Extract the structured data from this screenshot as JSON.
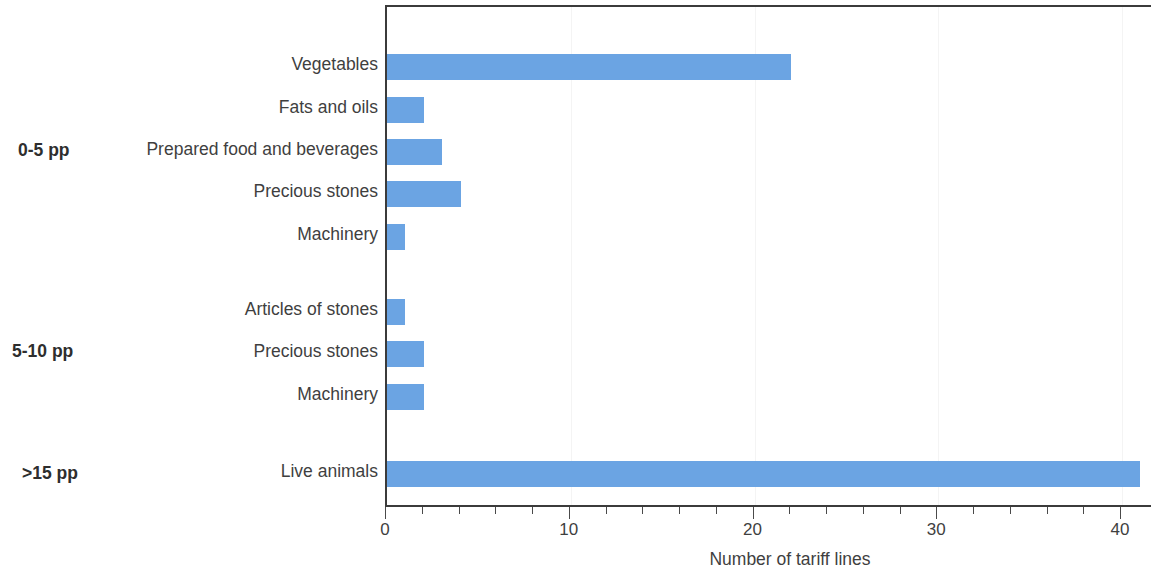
{
  "chart_data": {
    "type": "bar",
    "orientation": "horizontal",
    "title": "",
    "xlabel": "Number of tariff lines",
    "ylabel": "",
    "xlim": [
      0,
      41.7
    ],
    "xticks": [
      0,
      10,
      20,
      30,
      40
    ],
    "xtick_labels": [
      "0",
      "10",
      "20",
      "30",
      "40"
    ],
    "minor_tick_step": 2,
    "grid": "faint vertical gridlines at major ticks",
    "legend": "none",
    "bar_color": "#6ba4e3",
    "groups": [
      {
        "label": "0-5 pp",
        "categories": [
          "Vegetables",
          "Fats and oils",
          "Prepared food and beverages",
          "Precious stones",
          "Machinery"
        ],
        "values": [
          22,
          2,
          3,
          4,
          1
        ]
      },
      {
        "label": "5-10 pp",
        "categories": [
          "Articles of stones",
          "Precious stones",
          "Machinery"
        ],
        "values": [
          1,
          2,
          2
        ]
      },
      {
        "label": ">15 pp",
        "categories": [
          "Live animals"
        ],
        "values": [
          41
        ]
      }
    ]
  },
  "axis": {
    "x_title": "Number of tariff lines",
    "tick_labels": [
      "0",
      "10",
      "20",
      "30",
      "40"
    ]
  },
  "rows": [
    {
      "label": "Vegetables",
      "value": 22,
      "group": "0-5 pp"
    },
    {
      "label": "Fats and oils",
      "value": 2,
      "group": "0-5 pp"
    },
    {
      "label": "Prepared food and beverages",
      "value": 3,
      "group": "0-5 pp"
    },
    {
      "label": "Precious stones",
      "value": 4,
      "group": "0-5 pp"
    },
    {
      "label": "Machinery",
      "value": 1,
      "group": "0-5 pp"
    },
    {
      "label": "Articles of stones",
      "value": 1,
      "group": "5-10 pp"
    },
    {
      "label": "Precious stones",
      "value": 2,
      "group": "5-10 pp"
    },
    {
      "label": "Machinery",
      "value": 2,
      "group": "5-10 pp"
    },
    {
      "label": "Live animals",
      "value": 41,
      "group": ">15 pp"
    }
  ],
  "group_labels": [
    "0-5 pp",
    "5-10 pp",
    ">15 pp"
  ],
  "colors": {
    "bar": "#6ba4e3",
    "axis": "#3b3b3b",
    "text": "#3f3f3f",
    "grid": "#f4f4f4"
  }
}
